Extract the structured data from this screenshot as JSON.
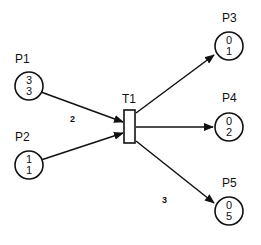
{
  "diagram": {
    "type": "petri-net",
    "places": [
      {
        "id": "P1",
        "label": "P1",
        "values": [
          "3",
          "3"
        ]
      },
      {
        "id": "P2",
        "label": "P2",
        "values": [
          "1",
          "1"
        ]
      },
      {
        "id": "P3",
        "label": "P3",
        "values": [
          "0",
          "1"
        ]
      },
      {
        "id": "P4",
        "label": "P4",
        "values": [
          "0",
          "2"
        ]
      },
      {
        "id": "P5",
        "label": "P5",
        "values": [
          "0",
          "5"
        ]
      }
    ],
    "transitions": [
      {
        "id": "T1",
        "label": "T1"
      }
    ],
    "arcs": [
      {
        "from": "P1",
        "to": "T1",
        "weight": "2"
      },
      {
        "from": "P2",
        "to": "T1",
        "weight": ""
      },
      {
        "from": "T1",
        "to": "P3",
        "weight": ""
      },
      {
        "from": "T1",
        "to": "P4",
        "weight": ""
      },
      {
        "from": "T1",
        "to": "P5",
        "weight": "3"
      }
    ]
  }
}
